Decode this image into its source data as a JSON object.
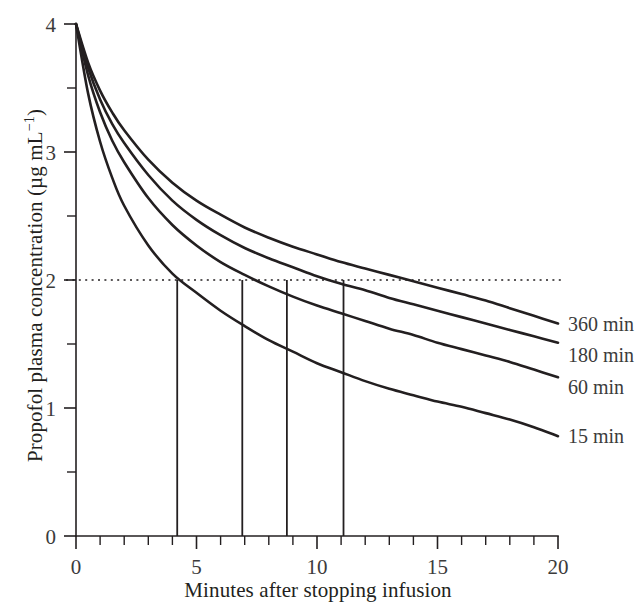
{
  "chart_data": {
    "type": "line",
    "title": "",
    "xlabel": "Minutes after stopping infusion",
    "ylabel": "Propofol plasma concentration (µg mL⁻¹)",
    "xlim": [
      0,
      20
    ],
    "ylim": [
      0,
      4
    ],
    "grid": false,
    "legend_position": "right-of-line-ends",
    "x_ticks_major": [
      0,
      5,
      10,
      15,
      20
    ],
    "x_tick_labels": [
      "0",
      "5",
      "10",
      "15",
      "20"
    ],
    "x_ticks_minor": [
      1,
      2,
      3,
      4,
      6,
      7,
      8,
      9,
      11,
      12,
      13,
      14,
      16,
      17,
      18,
      19
    ],
    "y_ticks_major": [
      0,
      1,
      2,
      3,
      4
    ],
    "y_tick_labels": [
      "0",
      "1",
      "2",
      "3",
      "4"
    ],
    "y_ticks_minor": [
      0.5,
      1.5,
      2.5,
      3.5
    ],
    "annotations": [
      {
        "name": "threshold-2ug",
        "type": "horizontal-dotted-line",
        "y": 2,
        "x_from": 0,
        "x_to": 20.1,
        "label": ""
      }
    ],
    "droplines": [
      {
        "series": "15 min",
        "x": 4.2,
        "y_from": 2,
        "y_to": 0
      },
      {
        "series": "60 min",
        "x": 6.9,
        "y_from": 2,
        "y_to": 0
      },
      {
        "series": "180 min",
        "x": 8.75,
        "y_from": 2,
        "y_to": 0
      },
      {
        "series": "360 min",
        "x": 11.1,
        "y_from": 2,
        "y_to": 0
      }
    ],
    "x": [
      0,
      0.5,
      1,
      1.5,
      2,
      3,
      4,
      5,
      6,
      7,
      8,
      9,
      10,
      11,
      12,
      13,
      14,
      15,
      16,
      17,
      18,
      19,
      20
    ],
    "series": [
      {
        "name": "15 min",
        "label": "15 min",
        "decrement_time_to_2": 4.2,
        "values": [
          4.0,
          3.46,
          3.08,
          2.8,
          2.58,
          2.27,
          2.05,
          1.9,
          1.76,
          1.64,
          1.53,
          1.44,
          1.35,
          1.28,
          1.21,
          1.15,
          1.1,
          1.05,
          1.01,
          0.96,
          0.91,
          0.85,
          0.78
        ]
      },
      {
        "name": "60 min",
        "label": "60 min",
        "decrement_time_to_2": 6.9,
        "values": [
          4.0,
          3.6,
          3.31,
          3.09,
          2.92,
          2.64,
          2.43,
          2.27,
          2.14,
          2.04,
          1.95,
          1.87,
          1.8,
          1.74,
          1.68,
          1.62,
          1.57,
          1.51,
          1.46,
          1.41,
          1.36,
          1.3,
          1.24
        ]
      },
      {
        "name": "180 min",
        "label": "180 min",
        "decrement_time_to_2": 8.75,
        "values": [
          4.0,
          3.66,
          3.41,
          3.22,
          3.07,
          2.82,
          2.62,
          2.47,
          2.35,
          2.25,
          2.17,
          2.1,
          2.03,
          1.97,
          1.92,
          1.86,
          1.81,
          1.76,
          1.71,
          1.66,
          1.61,
          1.56,
          1.51
        ]
      },
      {
        "name": "360 min",
        "label": "360 min",
        "decrement_time_to_2": 11.1,
        "values": [
          4.0,
          3.7,
          3.48,
          3.31,
          3.17,
          2.94,
          2.76,
          2.62,
          2.51,
          2.41,
          2.33,
          2.26,
          2.2,
          2.14,
          2.09,
          2.04,
          1.99,
          1.94,
          1.89,
          1.84,
          1.78,
          1.72,
          1.66
        ]
      }
    ]
  },
  "axis": {
    "x_title": "Minutes after stopping infusion",
    "y_title_prefix": "Propofol plasma concentration (µg mL",
    "y_title_sup": "−1",
    "y_title_suffix": ")"
  },
  "labels": {
    "x0": "0",
    "x5": "5",
    "x10": "10",
    "x15": "15",
    "x20": "20",
    "y0": "0",
    "y1": "1",
    "y2": "2",
    "y3": "3",
    "y4": "4",
    "s360": "360 min",
    "s180": "180 min",
    "s60": "60 min",
    "s15": "15 min"
  },
  "colors": {
    "ink": "#231f20",
    "text": "#3b3b3b",
    "background": "#ffffff"
  }
}
